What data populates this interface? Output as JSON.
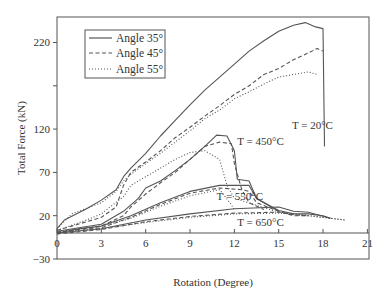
{
  "chart_data": {
    "type": "line",
    "title": "",
    "xlabel": "Rotation (Degree)",
    "ylabel": "Total Force (kN)",
    "xlim": [
      0,
      21
    ],
    "ylim": [
      -30,
      260
    ],
    "xticks": [
      0,
      3,
      6,
      9,
      12,
      15,
      18,
      21
    ],
    "xtick_labels": [
      "0",
      "3",
      "6",
      "9",
      "12",
      "15",
      "18",
      "21"
    ],
    "yticks": [
      -30,
      20,
      70,
      120,
      170,
      220
    ],
    "ytick_labels": [
      "−30",
      "20",
      "70",
      "120",
      "",
      "220"
    ],
    "grid": false,
    "legend": {
      "position": "upper left",
      "entries": [
        {
          "label": "Angle 35°",
          "style": "solid"
        },
        {
          "label": "Angle 45°",
          "style": "dashed"
        },
        {
          "label": "Angle 55°",
          "style": "dotted"
        }
      ]
    },
    "annotations": [
      {
        "text": "T = 20°C",
        "x": 15.9,
        "y": 120
      },
      {
        "text": "T = 450°C",
        "x": 12.2,
        "y": 102
      },
      {
        "text": "T = 550°C",
        "x": 10.8,
        "y": 38
      },
      {
        "text": "T = 650°C",
        "x": 12.2,
        "y": 8
      }
    ],
    "series": [
      {
        "name": "Angle 35°, T = 20°C",
        "style": "solid",
        "points": [
          [
            0,
            5
          ],
          [
            0.5,
            15
          ],
          [
            2,
            28
          ],
          [
            3,
            38
          ],
          [
            4,
            50
          ],
          [
            4.5,
            65
          ],
          [
            5,
            75
          ],
          [
            6,
            92
          ],
          [
            7,
            112
          ],
          [
            8,
            130
          ],
          [
            9,
            148
          ],
          [
            10,
            165
          ],
          [
            11,
            180
          ],
          [
            12,
            195
          ],
          [
            13,
            210
          ],
          [
            14,
            222
          ],
          [
            15,
            233
          ],
          [
            16,
            240
          ],
          [
            16.8,
            243
          ],
          [
            17.5,
            238
          ],
          [
            18,
            236
          ],
          [
            18.1,
            100
          ]
        ]
      },
      {
        "name": "Angle 45°, T = 20°C",
        "style": "dashed",
        "points": [
          [
            0,
            3
          ],
          [
            1,
            8
          ],
          [
            3,
            18
          ],
          [
            4,
            30
          ],
          [
            4.5,
            55
          ],
          [
            5,
            70
          ],
          [
            6,
            82
          ],
          [
            7,
            95
          ],
          [
            8,
            110
          ],
          [
            9,
            122
          ],
          [
            10,
            135
          ],
          [
            11,
            147
          ],
          [
            12,
            160
          ],
          [
            13,
            170
          ],
          [
            14,
            183
          ],
          [
            15,
            190
          ],
          [
            16,
            200
          ],
          [
            17,
            208
          ],
          [
            17.6,
            213
          ],
          [
            18,
            210
          ]
        ]
      },
      {
        "name": "Angle 55°, T = 20°C",
        "style": "dotted",
        "points": [
          [
            0,
            5
          ],
          [
            1,
            22
          ],
          [
            3,
            35
          ],
          [
            4,
            48
          ],
          [
            4.5,
            60
          ],
          [
            5,
            68
          ],
          [
            6,
            80
          ],
          [
            7,
            92
          ],
          [
            8,
            105
          ],
          [
            9,
            118
          ],
          [
            10,
            132
          ],
          [
            11,
            142
          ],
          [
            12,
            155
          ],
          [
            13,
            163
          ],
          [
            14,
            172
          ],
          [
            15,
            180
          ],
          [
            16,
            183
          ],
          [
            17,
            186
          ],
          [
            17.6,
            183
          ]
        ]
      },
      {
        "name": "Angle 35°, T = 450°C",
        "style": "solid",
        "points": [
          [
            0,
            2
          ],
          [
            3,
            10
          ],
          [
            4.5,
            25
          ],
          [
            5.5,
            40
          ],
          [
            6,
            52
          ],
          [
            7,
            60
          ],
          [
            8,
            72
          ],
          [
            9,
            85
          ],
          [
            10,
            100
          ],
          [
            10.8,
            113
          ],
          [
            11.5,
            112
          ],
          [
            12,
            95
          ],
          [
            12.2,
            62
          ],
          [
            13,
            60
          ],
          [
            13.5,
            40
          ],
          [
            15,
            26
          ],
          [
            16,
            22
          ],
          [
            17,
            22
          ],
          [
            18,
            20
          ],
          [
            18.5,
            17
          ]
        ]
      },
      {
        "name": "Angle 45°, T = 450°C",
        "style": "dashed",
        "points": [
          [
            0,
            1
          ],
          [
            3,
            8
          ],
          [
            4.5,
            20
          ],
          [
            5,
            30
          ],
          [
            6,
            45
          ],
          [
            7,
            58
          ],
          [
            8,
            70
          ],
          [
            9,
            85
          ],
          [
            10,
            100
          ],
          [
            11,
            105
          ],
          [
            11.8,
            103
          ],
          [
            12,
            80
          ],
          [
            12.5,
            50
          ],
          [
            13,
            48
          ],
          [
            13.5,
            35
          ],
          [
            15,
            25
          ],
          [
            16,
            20
          ],
          [
            17,
            20
          ]
        ]
      },
      {
        "name": "Angle 55°, T = 450°C",
        "style": "dotted",
        "points": [
          [
            0,
            3
          ],
          [
            2,
            15
          ],
          [
            3,
            22
          ],
          [
            4.5,
            42
          ],
          [
            5,
            55
          ],
          [
            6,
            65
          ],
          [
            7,
            75
          ],
          [
            8,
            85
          ],
          [
            9,
            93
          ],
          [
            10,
            95
          ],
          [
            11,
            85
          ],
          [
            11.5,
            55
          ],
          [
            12,
            40
          ],
          [
            15,
            24
          ],
          [
            17,
            20
          ],
          [
            18,
            18
          ],
          [
            19.5,
            15
          ]
        ]
      },
      {
        "name": "Angle 35°, T = 550°C",
        "style": "solid",
        "points": [
          [
            0,
            0
          ],
          [
            1.5,
            5
          ],
          [
            3,
            8
          ],
          [
            5,
            20
          ],
          [
            7,
            35
          ],
          [
            9,
            48
          ],
          [
            11,
            55
          ],
          [
            13,
            55
          ],
          [
            13.5,
            40
          ],
          [
            15,
            25
          ]
        ]
      },
      {
        "name": "Angle 45°, T = 550°C",
        "style": "dashed",
        "points": [
          [
            0,
            -1
          ],
          [
            1.5,
            4
          ],
          [
            3,
            6
          ],
          [
            5,
            18
          ],
          [
            7,
            33
          ],
          [
            9,
            46
          ],
          [
            11,
            52
          ],
          [
            12.5,
            50
          ],
          [
            13,
            35
          ],
          [
            14,
            27
          ]
        ]
      },
      {
        "name": "Angle 55°, T = 550°C",
        "style": "dotted",
        "points": [
          [
            0,
            1
          ],
          [
            1.5,
            5
          ],
          [
            3,
            8
          ],
          [
            5,
            17
          ],
          [
            7,
            31
          ],
          [
            9,
            43
          ],
          [
            11,
            50
          ],
          [
            11.7,
            35
          ],
          [
            12,
            27
          ]
        ]
      },
      {
        "name": "Angle 35°, T = 650°C",
        "style": "solid",
        "points": [
          [
            0,
            0
          ],
          [
            3,
            5
          ],
          [
            6,
            15
          ],
          [
            9,
            22
          ],
          [
            12,
            28
          ],
          [
            15,
            30
          ],
          [
            16,
            25
          ],
          [
            17,
            24
          ],
          [
            18.5,
            17
          ]
        ]
      },
      {
        "name": "Angle 45°, T = 650°C",
        "style": "dashed",
        "points": [
          [
            0,
            -1
          ],
          [
            3,
            4
          ],
          [
            6,
            13
          ],
          [
            9,
            19
          ],
          [
            12,
            23
          ],
          [
            15,
            24
          ],
          [
            16,
            21
          ],
          [
            17,
            20
          ]
        ]
      },
      {
        "name": "Angle 55°, T = 650°C",
        "style": "dotted",
        "points": [
          [
            0,
            1
          ],
          [
            3,
            5
          ],
          [
            6,
            12
          ],
          [
            9,
            18
          ],
          [
            12,
            22
          ],
          [
            15,
            23
          ],
          [
            16,
            22
          ],
          [
            17.5,
            19
          ],
          [
            19.5,
            15
          ]
        ]
      }
    ]
  }
}
